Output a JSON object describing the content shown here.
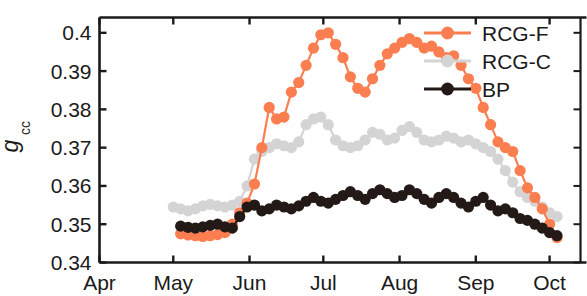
{
  "chart_data": {
    "type": "line",
    "title": "",
    "subtitle": "",
    "xlabel": "",
    "ylabel": "g_cc",
    "ylabel_main": "g",
    "ylabel_subscript": "cc",
    "ylim": [
      0.34,
      0.404
    ],
    "yticks": [
      0.34,
      0.35,
      0.36,
      0.37,
      0.38,
      0.39,
      0.4
    ],
    "ytick_labels": [
      "0.34",
      "0.35",
      "0.36",
      "0.37",
      "0.38",
      "0.39",
      "0.4"
    ],
    "xlim": [
      91,
      289
    ],
    "xticks": [
      91,
      121,
      152,
      182,
      213,
      244,
      274
    ],
    "xtick_labels": [
      "Apr",
      "May",
      "Jun",
      "Jul",
      "Aug",
      "Sep",
      "Oct"
    ],
    "grid": false,
    "legend_position": "top-right",
    "marker": "circle",
    "marker_size": 11,
    "colors": {
      "RCG-F": "#fb7e51",
      "RCG-C": "#d4d4d4",
      "BP": "#231a17",
      "axis": "#1a1a1a",
      "background": "#ffffff"
    },
    "series": [
      {
        "name": "RCG-F",
        "color": "#fb7e51",
        "x": [
          124,
          127,
          130,
          133,
          136,
          139,
          142,
          145,
          148,
          151,
          154,
          157,
          160,
          163,
          166,
          169,
          172,
          175,
          178,
          181,
          184,
          187,
          190,
          193,
          196,
          199,
          202,
          205,
          208,
          211,
          214,
          217,
          220,
          223,
          226,
          229,
          232,
          235,
          238,
          241,
          244,
          247,
          250,
          253,
          256,
          259,
          262,
          265,
          268,
          271,
          274,
          277
        ],
        "y": [
          0.3475,
          0.3472,
          0.347,
          0.3468,
          0.347,
          0.3473,
          0.3478,
          0.35,
          0.353,
          0.3555,
          0.3605,
          0.37,
          0.3805,
          0.3775,
          0.378,
          0.3845,
          0.387,
          0.3915,
          0.396,
          0.3995,
          0.4,
          0.397,
          0.3935,
          0.3885,
          0.3855,
          0.3845,
          0.388,
          0.3915,
          0.3945,
          0.396,
          0.3975,
          0.3985,
          0.3975,
          0.396,
          0.3965,
          0.395,
          0.3935,
          0.394,
          0.3915,
          0.388,
          0.3855,
          0.3805,
          0.376,
          0.3715,
          0.37,
          0.369,
          0.364,
          0.3595,
          0.357,
          0.354,
          0.35,
          0.3465
        ],
        "label": "RCG-F"
      },
      {
        "name": "RCG-C",
        "color": "#d4d4d4",
        "x": [
          121,
          124,
          127,
          130,
          133,
          136,
          139,
          142,
          145,
          148,
          151,
          154,
          157,
          160,
          163,
          166,
          169,
          172,
          175,
          178,
          181,
          184,
          187,
          190,
          193,
          196,
          199,
          202,
          205,
          208,
          211,
          214,
          217,
          220,
          223,
          226,
          229,
          232,
          235,
          238,
          241,
          244,
          247,
          250,
          253,
          256,
          259,
          262,
          265,
          268,
          271,
          274,
          277
        ],
        "y": [
          0.3545,
          0.354,
          0.3535,
          0.354,
          0.3548,
          0.3552,
          0.3548,
          0.3545,
          0.355,
          0.356,
          0.36,
          0.367,
          0.369,
          0.37,
          0.371,
          0.3705,
          0.37,
          0.3715,
          0.376,
          0.3775,
          0.378,
          0.376,
          0.372,
          0.3705,
          0.37,
          0.3705,
          0.372,
          0.374,
          0.3735,
          0.372,
          0.3725,
          0.3745,
          0.3755,
          0.374,
          0.372,
          0.3715,
          0.372,
          0.373,
          0.3725,
          0.3715,
          0.372,
          0.371,
          0.37,
          0.369,
          0.367,
          0.364,
          0.361,
          0.3585,
          0.357,
          0.356,
          0.3545,
          0.353,
          0.352
        ],
        "label": "RCG-C"
      },
      {
        "name": "BP",
        "color": "#231a17",
        "x": [
          124,
          127,
          130,
          133,
          136,
          139,
          142,
          145,
          148,
          151,
          154,
          157,
          160,
          163,
          166,
          169,
          172,
          175,
          178,
          181,
          184,
          187,
          190,
          193,
          196,
          199,
          202,
          205,
          208,
          211,
          214,
          217,
          220,
          223,
          226,
          229,
          232,
          235,
          238,
          241,
          244,
          247,
          250,
          253,
          256,
          259,
          262,
          265,
          268,
          271,
          274,
          277
        ],
        "y": [
          0.3495,
          0.3492,
          0.349,
          0.3493,
          0.3497,
          0.35,
          0.3493,
          0.349,
          0.352,
          0.3545,
          0.355,
          0.3535,
          0.354,
          0.355,
          0.3545,
          0.354,
          0.3548,
          0.356,
          0.357,
          0.356,
          0.3555,
          0.3565,
          0.3575,
          0.3585,
          0.3575,
          0.3565,
          0.358,
          0.359,
          0.358,
          0.357,
          0.3575,
          0.359,
          0.358,
          0.3565,
          0.3555,
          0.357,
          0.358,
          0.357,
          0.3555,
          0.3545,
          0.356,
          0.357,
          0.355,
          0.3535,
          0.354,
          0.353,
          0.3515,
          0.351,
          0.35,
          0.349,
          0.3478,
          0.347
        ],
        "label": "BP"
      }
    ]
  },
  "legend": {
    "items": [
      {
        "label": "RCG-F",
        "color": "#fb7e51"
      },
      {
        "label": "RCG-C",
        "color": "#d4d4d4"
      },
      {
        "label": "BP",
        "color": "#231a17"
      }
    ]
  },
  "axes": {
    "y_label_main": "g",
    "y_label_sub": "cc",
    "y_ticks": [
      "0.4",
      "0.39",
      "0.38",
      "0.37",
      "0.36",
      "0.35",
      "0.34"
    ],
    "x_ticks": [
      "Apr",
      "May",
      "Jun",
      "Jul",
      "Aug",
      "Sep",
      "Oct"
    ]
  }
}
